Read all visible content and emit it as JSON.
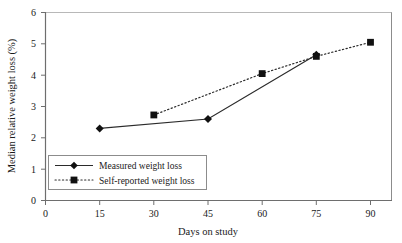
{
  "chart_data": {
    "type": "line",
    "title": "",
    "xlabel": "Days on study",
    "ylabel": "Median relative weight loss (%)",
    "xlim": [
      0,
      90
    ],
    "ylim": [
      0,
      6
    ],
    "xticks": [
      0,
      15,
      30,
      45,
      60,
      75,
      90
    ],
    "yticks": [
      0,
      1,
      2,
      3,
      4,
      5,
      6
    ],
    "xtick_labels": [
      "0",
      "15",
      "30",
      "45",
      "60",
      "75",
      "90"
    ],
    "ytick_labels": [
      "0",
      "1",
      "2",
      "3",
      "4",
      "5",
      "6"
    ],
    "grid": false,
    "legend_position": "lower-left",
    "series": [
      {
        "name": "Measured weight loss",
        "marker": "diamond",
        "linestyle": "solid",
        "color": "#2b2b2b",
        "x": [
          15,
          45,
          75
        ],
        "values": [
          2.3,
          2.6,
          4.65
        ]
      },
      {
        "name": "Self-reported weight loss",
        "marker": "square",
        "linestyle": "dotted",
        "color": "#2b2b2b",
        "x": [
          30,
          60,
          75,
          90
        ],
        "values": [
          2.73,
          4.05,
          4.6,
          5.05
        ]
      }
    ]
  },
  "legend": {
    "entries": [
      {
        "label": "Measured weight loss"
      },
      {
        "label": "Self-reported weight loss"
      }
    ]
  },
  "colors": {
    "line": "#2b2b2b",
    "frame": "#8c8c8c",
    "axis": "#6e6e6e",
    "text": "#1a1a1a",
    "background": "#ffffff"
  }
}
